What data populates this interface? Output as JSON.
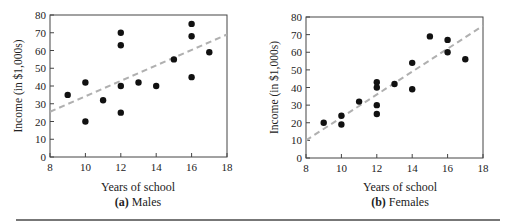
{
  "chart_data": [
    {
      "type": "scatter",
      "title": "",
      "subtitle_letter": "(a)",
      "subtitle": "Males",
      "xlabel": "Years of school",
      "ylabel": "Income (in $1,000s)",
      "xlim": [
        8,
        18
      ],
      "ylim": [
        0,
        80
      ],
      "xticks": [
        8,
        10,
        12,
        14,
        16,
        18
      ],
      "yticks": [
        0,
        10,
        20,
        30,
        40,
        50,
        60,
        70,
        80
      ],
      "grid": false,
      "legend": null,
      "points": [
        {
          "x": 9,
          "y": 35
        },
        {
          "x": 10,
          "y": 42
        },
        {
          "x": 10,
          "y": 20
        },
        {
          "x": 11,
          "y": 32
        },
        {
          "x": 12,
          "y": 70
        },
        {
          "x": 12,
          "y": 63
        },
        {
          "x": 12,
          "y": 40
        },
        {
          "x": 12,
          "y": 25
        },
        {
          "x": 13,
          "y": 42
        },
        {
          "x": 14,
          "y": 40
        },
        {
          "x": 15,
          "y": 55
        },
        {
          "x": 16,
          "y": 75
        },
        {
          "x": 16,
          "y": 68
        },
        {
          "x": 16,
          "y": 45
        },
        {
          "x": 17,
          "y": 59
        }
      ],
      "trend_line": {
        "style": "dashed",
        "color": "#b0b0b0",
        "x": [
          8,
          18
        ],
        "y": [
          25.5,
          69
        ]
      }
    },
    {
      "type": "scatter",
      "title": "",
      "subtitle_letter": "(b)",
      "subtitle": "Females",
      "xlabel": "Years of school",
      "ylabel": "Income (in $1,000s)",
      "xlim": [
        8,
        18
      ],
      "ylim": [
        0,
        80
      ],
      "xticks": [
        8,
        10,
        12,
        14,
        16,
        18
      ],
      "yticks": [
        0,
        10,
        20,
        30,
        40,
        50,
        60,
        70,
        80
      ],
      "grid": false,
      "legend": null,
      "points": [
        {
          "x": 9,
          "y": 20
        },
        {
          "x": 10,
          "y": 24
        },
        {
          "x": 10,
          "y": 19
        },
        {
          "x": 11,
          "y": 32
        },
        {
          "x": 12,
          "y": 43
        },
        {
          "x": 12,
          "y": 40
        },
        {
          "x": 12,
          "y": 30
        },
        {
          "x": 12,
          "y": 25
        },
        {
          "x": 13,
          "y": 42
        },
        {
          "x": 14,
          "y": 54
        },
        {
          "x": 14,
          "y": 39
        },
        {
          "x": 15,
          "y": 69
        },
        {
          "x": 16,
          "y": 67
        },
        {
          "x": 16,
          "y": 60
        },
        {
          "x": 17,
          "y": 56
        }
      ],
      "trend_line": {
        "style": "dashed",
        "color": "#b0b0b0",
        "x": [
          8,
          18
        ],
        "y": [
          10,
          75
        ]
      }
    }
  ],
  "colors": {
    "points": "#111111",
    "axis": "#444444",
    "trend": "#b0b0b0",
    "rule": "#777777"
  }
}
